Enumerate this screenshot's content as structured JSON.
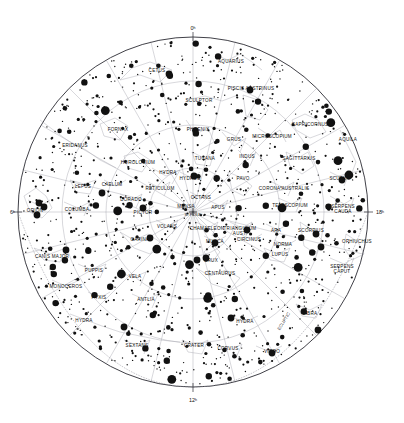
{
  "chart_data": {
    "type": "scatter",
    "projection": "polar azimuthal (south polar)",
    "center_label": "S. POLE",
    "ecliptic_label": "ECLIPTIC",
    "grid": true,
    "legend": "none",
    "xlabel": "Right Ascension (hours)",
    "ylabel": "Declination",
    "hour_labels": [
      "0ʰ",
      "6ʰ",
      "12ʰ",
      "18ʰ"
    ],
    "hour_positions": [
      "top",
      "left",
      "bottom",
      "right"
    ],
    "magnitude_sizes": [
      0.7,
      1.1,
      1.6,
      2.3,
      3.2,
      4.4
    ],
    "constellations": [
      {
        "name": "CETUS",
        "x": 157,
        "y": 72
      },
      {
        "name": "AQUARIUS",
        "x": 231,
        "y": 63
      },
      {
        "name": "SCULPTOR",
        "x": 199,
        "y": 102
      },
      {
        "name": "PISCIS AUSTRINUS",
        "x": 251,
        "y": 90
      },
      {
        "name": "CAPRICORNUS",
        "x": 310,
        "y": 126
      },
      {
        "name": "AQUILA",
        "x": 348,
        "y": 141
      },
      {
        "name": "FORNAX",
        "x": 118,
        "y": 131
      },
      {
        "name": "PHOENIX",
        "x": 198,
        "y": 131
      },
      {
        "name": "GRUS",
        "x": 234,
        "y": 141
      },
      {
        "name": "MICROSCOPIUM",
        "x": 272,
        "y": 138
      },
      {
        "name": "ERIDANUS",
        "x": 75,
        "y": 147
      },
      {
        "name": "HOROLOGIUM",
        "x": 138,
        "y": 164
      },
      {
        "name": "TUCANA",
        "x": 205,
        "y": 160
      },
      {
        "name": "INDUS",
        "x": 247,
        "y": 158
      },
      {
        "name": "SAGITTARIUS",
        "x": 299,
        "y": 160
      },
      {
        "name": "HYDRA",
        "x": 168,
        "y": 174
      },
      {
        "name": "PAVO",
        "x": 243,
        "y": 180
      },
      {
        "name": "SCUTUM",
        "x": 340,
        "y": 180
      },
      {
        "name": "LEPUS",
        "x": 83,
        "y": 188
      },
      {
        "name": "CAELUM",
        "x": 112,
        "y": 186
      },
      {
        "name": "RETICULUM",
        "x": 160,
        "y": 190
      },
      {
        "name": "HYDRUS",
        "x": 190,
        "y": 180
      },
      {
        "name": "CORONA AUSTRALIS",
        "x": 284,
        "y": 190
      },
      {
        "name": "OCTANS",
        "x": 201,
        "y": 199
      },
      {
        "name": "DORADO",
        "x": 131,
        "y": 201
      },
      {
        "name": "MENSA",
        "x": 186,
        "y": 208
      },
      {
        "name": "ORION",
        "x": 35,
        "y": 212
      },
      {
        "name": "COLUMBA",
        "x": 77,
        "y": 211
      },
      {
        "name": "PICTOR",
        "x": 143,
        "y": 214
      },
      {
        "name": "S. POLE",
        "x": 193,
        "y": 216
      },
      {
        "name": "APUS",
        "x": 218,
        "y": 209
      },
      {
        "name": "TELESCOPIUM",
        "x": 290,
        "y": 207
      },
      {
        "name": "SERPENS CAUDA",
        "x": 343,
        "y": 208
      },
      {
        "name": "VOLANS",
        "x": 167,
        "y": 228
      },
      {
        "name": "CHAMAELEON",
        "x": 207,
        "y": 230
      },
      {
        "name": "TRIANGULUM AUST.",
        "x": 240,
        "y": 230
      },
      {
        "name": "ARA",
        "x": 276,
        "y": 232
      },
      {
        "name": "SCORPIUS",
        "x": 311,
        "y": 232
      },
      {
        "name": "CARINA",
        "x": 140,
        "y": 241
      },
      {
        "name": "MUSCA",
        "x": 215,
        "y": 243
      },
      {
        "name": "CIRCINUS",
        "x": 249,
        "y": 241
      },
      {
        "name": "NORMA",
        "x": 283,
        "y": 246
      },
      {
        "name": "OPHIUCHUS",
        "x": 357,
        "y": 243
      },
      {
        "name": "CANIS MAJOR",
        "x": 52,
        "y": 258
      },
      {
        "name": "CRUX",
        "x": 211,
        "y": 262
      },
      {
        "name": "LUPUS",
        "x": 280,
        "y": 256
      },
      {
        "name": "PUPPIS",
        "x": 94,
        "y": 272
      },
      {
        "name": "VELA",
        "x": 135,
        "y": 278
      },
      {
        "name": "CENTAURUS",
        "x": 220,
        "y": 275
      },
      {
        "name": "SERPENS CAPUT",
        "x": 342,
        "y": 268
      },
      {
        "name": "MONOCEROS",
        "x": 66,
        "y": 288
      },
      {
        "name": "PYXIS",
        "x": 99,
        "y": 299
      },
      {
        "name": "ANTLIA",
        "x": 146,
        "y": 301
      },
      {
        "name": "HYDRA",
        "x": 84,
        "y": 322
      },
      {
        "name": "HYDRA",
        "x": 245,
        "y": 323
      },
      {
        "name": "LIBRA",
        "x": 310,
        "y": 315
      },
      {
        "name": "ECLIPTIC",
        "x": 285,
        "y": 322
      },
      {
        "name": "SEXTANS",
        "x": 137,
        "y": 347
      },
      {
        "name": "CRATER",
        "x": 194,
        "y": 347
      },
      {
        "name": "CORVUS",
        "x": 228,
        "y": 350
      },
      {
        "name": "VIRGO",
        "x": 272,
        "y": 353
      }
    ]
  }
}
